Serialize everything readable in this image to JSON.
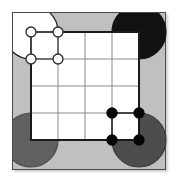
{
  "figure": {
    "title": "",
    "canvas": {
      "width": 180,
      "height": 186
    },
    "background_color": "#ffffff",
    "plate_color": "#c0c0c0",
    "frame_color": "#4a4a4a",
    "cell_fill_color": "#ffffff",
    "grid_line_color": "#8a8a8a",
    "edge_line_color": "#1a1a1a"
  },
  "board": {
    "type": "square-lattice",
    "columns": 4,
    "rows": 4,
    "origin_x": 31,
    "origin_y": 32,
    "cell_size": 27,
    "description": "4 by 4 grid of white square cells on a gray plate"
  },
  "corner_disks": [
    {
      "name": "top-left-disk",
      "position": "top-left",
      "center_x": 31,
      "center_y": 32,
      "radius": 27,
      "fill": "#ffffff",
      "stroke": "#1a1a1a",
      "label": "white"
    },
    {
      "name": "top-right-disk",
      "position": "top-right",
      "center_x": 139,
      "center_y": 32,
      "radius": 27,
      "fill": "#111111",
      "stroke": "#111111",
      "label": "black"
    },
    {
      "name": "bottom-left-disk",
      "position": "bottom-left",
      "center_x": 31,
      "center_y": 140,
      "radius": 27,
      "fill": "#606060",
      "stroke": "#4a4a4a",
      "label": "gray"
    },
    {
      "name": "bottom-right-disk",
      "position": "bottom-right",
      "center_x": 139,
      "center_y": 140,
      "radius": 27,
      "fill": "#4d4d4d",
      "stroke": "#3a3a3a",
      "label": "gray"
    }
  ],
  "node_groups": [
    {
      "name": "white-node-square",
      "fill": "#ffffff",
      "stroke": "#2a2a2a",
      "node_radius": 5,
      "edge_color": "#555555",
      "nodes": [
        {
          "id": "w1",
          "x": 31,
          "y": 32
        },
        {
          "id": "w2",
          "x": 58,
          "y": 32
        },
        {
          "id": "w3",
          "x": 31,
          "y": 59
        },
        {
          "id": "w4",
          "x": 58,
          "y": 59
        }
      ],
      "edges": [
        [
          "w1",
          "w2"
        ],
        [
          "w2",
          "w4"
        ],
        [
          "w4",
          "w3"
        ],
        [
          "w3",
          "w1"
        ]
      ]
    },
    {
      "name": "black-node-square",
      "fill": "#050505",
      "stroke": "#050505",
      "node_radius": 5,
      "edge_color": "#1a1a1a",
      "nodes": [
        {
          "id": "b1",
          "x": 112,
          "y": 113
        },
        {
          "id": "b2",
          "x": 139,
          "y": 113
        },
        {
          "id": "b3",
          "x": 112,
          "y": 140
        },
        {
          "id": "b4",
          "x": 139,
          "y": 140
        }
      ],
      "edges": [
        [
          "b1",
          "b2"
        ],
        [
          "b2",
          "b4"
        ],
        [
          "b4",
          "b3"
        ],
        [
          "b3",
          "b1"
        ]
      ]
    }
  ],
  "thick_outline": {
    "name": "board-outline-path",
    "color": "#1a1a1a",
    "width": 2,
    "description": "Heavy black border tracing the outer boundary of the 4 by 4 cell region"
  }
}
